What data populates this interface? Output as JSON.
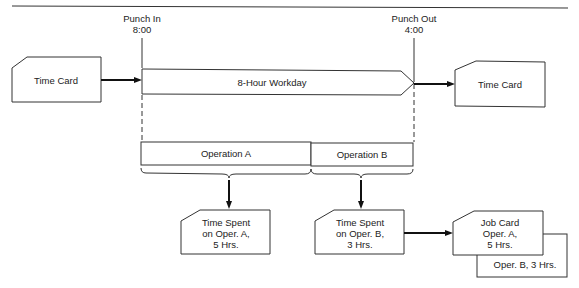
{
  "diagram": {
    "title_partial": "... Job Cards",
    "punch_in": {
      "label": "Punch In",
      "time": "8:00"
    },
    "punch_out": {
      "label": "Punch Out",
      "time": "4:00"
    },
    "time_card_in": {
      "label": "Time Card"
    },
    "time_card_out": {
      "label": "Time Card"
    },
    "workday": {
      "label": "8-Hour Workday"
    },
    "operations": [
      {
        "label": "Operation A"
      },
      {
        "label": "Operation B"
      }
    ],
    "time_spent_a": {
      "lines": [
        "Time Spent",
        "on Oper. A,",
        "5 Hrs."
      ]
    },
    "time_spent_b": {
      "lines": [
        "Time Spent",
        "on Oper. B,",
        "3 Hrs."
      ]
    },
    "job_card": {
      "lines": [
        "Job Card",
        "Oper. A,",
        "5 Hrs."
      ],
      "back_card": "Oper. B, 3 Hrs."
    },
    "colors": {
      "stroke": "#333333",
      "fill": "#ffffff",
      "text": "#222222"
    }
  }
}
